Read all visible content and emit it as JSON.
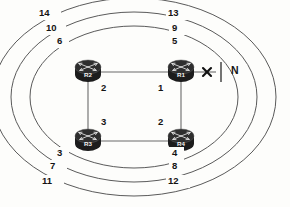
{
  "diagram": {
    "type": "network-topology",
    "title": "",
    "colors": {
      "background": "#fdfdfb",
      "ring_stroke": "#5a5a5a",
      "link_stroke": "#6b6b6b",
      "router_body": "#1c1c1c",
      "text": "#141414"
    }
  },
  "routers": [
    {
      "id": "r2",
      "label": "R2",
      "x": 88,
      "y": 72,
      "icon": "router-icon"
    },
    {
      "id": "r1",
      "label": "R1",
      "x": 181,
      "y": 72,
      "icon": "router-icon"
    },
    {
      "id": "r3",
      "label": "R3",
      "x": 88,
      "y": 141,
      "icon": "router-icon"
    },
    {
      "id": "r4",
      "label": "R4",
      "x": 181,
      "y": 141,
      "icon": "router-icon"
    }
  ],
  "interface_numbers": [
    {
      "id": "iface-r2",
      "value": "2",
      "x": 103,
      "y": 85
    },
    {
      "id": "iface-r1",
      "value": "1",
      "x": 160,
      "y": 85
    },
    {
      "id": "iface-r3",
      "value": "3",
      "x": 103,
      "y": 120
    },
    {
      "id": "iface-r4",
      "value": "2",
      "x": 160,
      "y": 120
    }
  ],
  "network": {
    "label": "N",
    "label_x": 234,
    "label_y": 65,
    "failure_mark": "x-failure-icon",
    "failure_x": 207,
    "failure_y": 72
  },
  "rings": [
    {
      "id": "ring-inner",
      "rx": 104,
      "ry": 71,
      "labels": [
        {
          "id": "ring-inner-top-left",
          "value": "6",
          "x": 59,
          "y": 41
        },
        {
          "id": "ring-inner-top-right",
          "value": "5",
          "x": 174,
          "y": 41
        },
        {
          "id": "ring-inner-bottom-left",
          "value": "3",
          "x": 59,
          "y": 153
        },
        {
          "id": "ring-inner-bottom-right",
          "value": "4",
          "x": 174,
          "y": 153
        }
      ]
    },
    {
      "id": "ring-middle",
      "rx": 123,
      "ry": 85,
      "labels": [
        {
          "id": "ring-middle-top-left",
          "value": "10",
          "x": 50,
          "y": 28
        },
        {
          "id": "ring-middle-top-right",
          "value": "9",
          "x": 175,
          "y": 28
        },
        {
          "id": "ring-middle-bottom-left",
          "value": "7",
          "x": 53,
          "y": 166
        },
        {
          "id": "ring-middle-bottom-right",
          "value": "8",
          "x": 175,
          "y": 166
        }
      ]
    },
    {
      "id": "ring-outer",
      "rx": 142,
      "ry": 99,
      "labels": [
        {
          "id": "ring-outer-top-left",
          "value": "14",
          "x": 43,
          "y": 13
        },
        {
          "id": "ring-outer-top-right",
          "value": "13",
          "x": 172,
          "y": 13
        },
        {
          "id": "ring-outer-bottom-left",
          "value": "11",
          "x": 46,
          "y": 181
        },
        {
          "id": "ring-outer-bottom-right",
          "value": "12",
          "x": 172,
          "y": 181
        }
      ]
    }
  ],
  "links": [
    {
      "id": "link-r2-r1",
      "from": "r2",
      "to": "r1"
    },
    {
      "id": "link-r3-r4",
      "from": "r3",
      "to": "r4"
    },
    {
      "id": "link-r2-r3",
      "from": "r2",
      "to": "r3"
    },
    {
      "id": "link-r1-r4",
      "from": "r1",
      "to": "r4"
    },
    {
      "id": "link-r1-n",
      "from": "r1",
      "to": "N",
      "status": "failed"
    }
  ]
}
